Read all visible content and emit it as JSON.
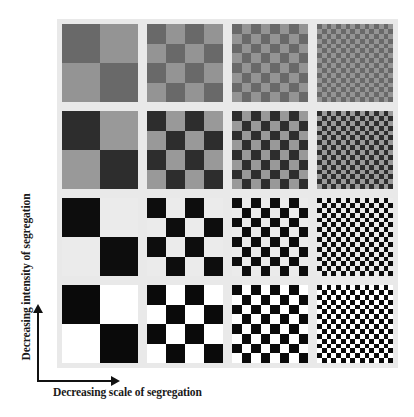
{
  "figure": {
    "panel_background": "#e9e9e9",
    "x_axis_label": "Decreasing scale of segregation",
    "y_axis_label": "Decreasing intensity of segregation",
    "columns": [
      {
        "index": 0,
        "x": 62,
        "divisions": 2
      },
      {
        "index": 1,
        "x": 147,
        "divisions": 4
      },
      {
        "index": 2,
        "x": 232,
        "divisions": 8
      },
      {
        "index": 3,
        "x": 317,
        "divisions": 16
      }
    ],
    "rows": [
      {
        "index": 0,
        "y": 24,
        "dark": "#696969",
        "light": "#949494"
      },
      {
        "index": 1,
        "y": 111,
        "dark": "#2d2d2d",
        "light": "#999999"
      },
      {
        "index": 2,
        "y": 198,
        "dark": "#0d0d0d",
        "light": "#ebebeb"
      },
      {
        "index": 3,
        "y": 285,
        "dark": "#0a0a0a",
        "light": "#ffffff"
      }
    ],
    "tile_size": {
      "width": 76,
      "height": 78
    }
  }
}
